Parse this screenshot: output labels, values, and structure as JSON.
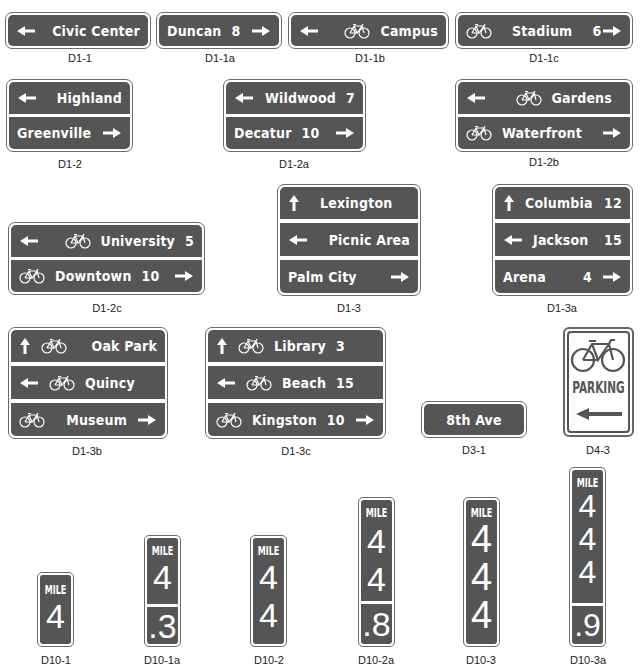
{
  "signs": {
    "d1_1": {
      "code": "D1-1",
      "rows": [
        {
          "dest": "Civic Center"
        }
      ]
    },
    "d1_1a": {
      "code": "D1-1a",
      "rows": [
        {
          "dest": "Duncan",
          "dist": "8"
        }
      ]
    },
    "d1_1b": {
      "code": "D1-1b",
      "rows": [
        {
          "dest": "Campus"
        }
      ]
    },
    "d1_1c": {
      "code": "D1-1c",
      "rows": [
        {
          "dest": "Stadium",
          "dist": "6"
        }
      ]
    },
    "d1_2": {
      "code": "D1-2",
      "rows": [
        {
          "dest": "Highland"
        },
        {
          "dest": "Greenville"
        }
      ]
    },
    "d1_2a": {
      "code": "D1-2a",
      "rows": [
        {
          "dest": "Wildwood",
          "dist": "7"
        },
        {
          "dest": "Decatur",
          "dist": "10"
        }
      ]
    },
    "d1_2b": {
      "code": "D1-2b",
      "rows": [
        {
          "dest": "Gardens"
        },
        {
          "dest": "Waterfront"
        }
      ]
    },
    "d1_2c": {
      "code": "D1-2c",
      "rows": [
        {
          "dest": "University",
          "dist": "5"
        },
        {
          "dest": "Downtown",
          "dist": "10"
        }
      ]
    },
    "d1_3": {
      "code": "D1-3",
      "rows": [
        {
          "dest": "Lexington"
        },
        {
          "dest": "Picnic Area"
        },
        {
          "dest": "Palm City"
        }
      ]
    },
    "d1_3a": {
      "code": "D1-3a",
      "rows": [
        {
          "dest": "Columbia",
          "dist": "12"
        },
        {
          "dest": "Jackson",
          "dist": "15"
        },
        {
          "dest": "Arena",
          "dist": "4"
        }
      ]
    },
    "d1_3b": {
      "code": "D1-3b",
      "rows": [
        {
          "dest": "Oak Park"
        },
        {
          "dest": "Quincy"
        },
        {
          "dest": "Museum"
        }
      ]
    },
    "d1_3c": {
      "code": "D1-3c",
      "rows": [
        {
          "dest": "Library",
          "dist": "3"
        },
        {
          "dest": "Beach",
          "dist": "15"
        },
        {
          "dest": "Kingston",
          "dist": "10"
        }
      ]
    },
    "d3_1": {
      "code": "D3-1",
      "text": "8th Ave"
    },
    "d4_3": {
      "code": "D4-3",
      "text": "PARKING"
    },
    "d10_1": {
      "code": "D10-1",
      "word": "MILE",
      "digits": [
        "4"
      ]
    },
    "d10_1a": {
      "code": "D10-1a",
      "word": "MILE",
      "digits": [
        "4"
      ],
      "fraction": ".3"
    },
    "d10_2": {
      "code": "D10-2",
      "word": "MILE",
      "digits": [
        "4",
        "4"
      ]
    },
    "d10_2a": {
      "code": "D10-2a",
      "word": "MILE",
      "digits": [
        "4",
        "4"
      ],
      "fraction": ".8"
    },
    "d10_3": {
      "code": "D10-3",
      "word": "MILE",
      "digits": [
        "4",
        "4",
        "4"
      ]
    },
    "d10_3a": {
      "code": "D10-3a",
      "word": "MILE",
      "digits": [
        "4",
        "4",
        "4"
      ],
      "fraction": ".9"
    }
  },
  "icons": {
    "arrow_left": "arrow-left-icon",
    "arrow_right": "arrow-right-icon",
    "arrow_up": "arrow-up-icon",
    "bicycle": "bicycle-icon"
  },
  "colors": {
    "sign_panel": "#555555",
    "sign_border": "#6a6a6a",
    "legend": "#ffffff",
    "background": "#ffffff",
    "label_text": "#222222"
  }
}
